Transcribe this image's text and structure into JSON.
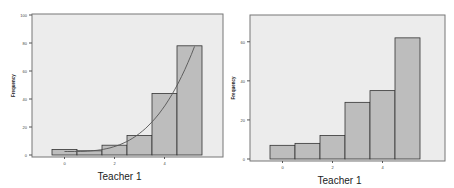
{
  "chart_data": [
    {
      "type": "bar",
      "title": "",
      "xlabel": "Teacher 1",
      "ylabel": "Frequency",
      "ylim": [
        0,
        100
      ],
      "yticks": [
        0,
        20,
        40,
        60,
        80,
        100
      ],
      "xticks": [
        "0",
        "2",
        "4"
      ],
      "categories": [
        "-0.5-0.5",
        "0.5-1.5",
        "1.5-2.5",
        "2.5-3.5",
        "3.5-4.5",
        "4.5-5.5"
      ],
      "values": [
        4,
        3,
        7,
        14,
        44,
        78
      ],
      "overlay": "fitted curve",
      "grid": false,
      "legend": "none"
    },
    {
      "type": "bar",
      "title": "",
      "xlabel": "Teacher 1",
      "ylabel": "Frequency",
      "ylim": [
        0,
        65
      ],
      "yticks": [
        0,
        20,
        40,
        60
      ],
      "xticks": [
        "0",
        "2",
        "4"
      ],
      "categories": [
        "-0.5-0.5",
        "0.5-1.5",
        "1.5-2.5",
        "2.5-3.5",
        "3.5-4.5",
        "4.5-5.5"
      ],
      "values": [
        7,
        8,
        12,
        29,
        35,
        62
      ],
      "grid": false,
      "legend": "none"
    }
  ],
  "colors": {
    "plot_bg": "#ececec",
    "bar_fill": "#bdbdbd",
    "bar_stroke": "#333333",
    "curve": "#555555",
    "frame": "#777777"
  }
}
